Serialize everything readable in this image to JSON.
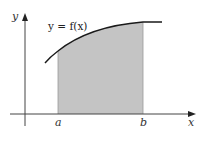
{
  "diagram": {
    "curve_label": "y = f(x)",
    "axes": {
      "x_label": "x",
      "y_label": "y"
    },
    "bounds": {
      "lower_label": "a",
      "upper_label": "b"
    },
    "colors": {
      "curve": "#1a1a1a",
      "axis": "#444444",
      "shade": "#c4c4c4",
      "shade_edge": "#888888",
      "background": "#ffffff"
    }
  }
}
